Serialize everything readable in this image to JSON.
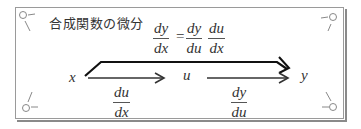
{
  "title": "合成関数の微分",
  "formula": {
    "lhs": {
      "num": "dy",
      "den": "dx"
    },
    "equals": "=",
    "rhs": [
      {
        "num": "dy",
        "den": "du"
      },
      {
        "num": "du",
        "den": "dx"
      }
    ]
  },
  "chain": {
    "nodes": [
      "x",
      "u",
      "y"
    ],
    "arrows": [
      {
        "from": "x",
        "to": "u",
        "label": {
          "num": "du",
          "den": "dx"
        }
      },
      {
        "from": "u",
        "to": "y",
        "label": {
          "num": "dy",
          "den": "du"
        }
      },
      {
        "from": "x",
        "to": "y",
        "label": null
      }
    ]
  },
  "colors": {
    "frame": "#9a9a9a",
    "arrow_thin": "#555555",
    "arrow_thick": "#111111",
    "text": "#333333"
  }
}
